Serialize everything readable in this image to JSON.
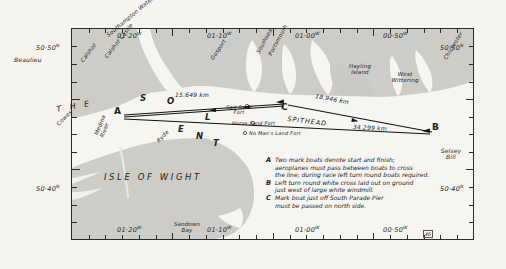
{
  "map": {
    "title": "The Solent air race course map",
    "plate_number": "46",
    "region_labels": {
      "the": "T H E",
      "solent": "S O L E N T",
      "isle_of_wight": "ISLE OF WIGHT",
      "spithead": "SPITHEAD"
    },
    "places": [
      {
        "name": "Beaulieu",
        "x": 14,
        "y": 60
      },
      {
        "name": "Calshot",
        "x": 86,
        "y": 62
      },
      {
        "name": "Calshot Castle",
        "x": 112,
        "y": 58
      },
      {
        "name": "Southampton Water",
        "x": 110,
        "y": 38
      },
      {
        "name": "Gosport",
        "x": 218,
        "y": 62
      },
      {
        "name": "Southsea",
        "x": 262,
        "y": 55
      },
      {
        "name": "Portsmouth",
        "x": 275,
        "y": 56
      },
      {
        "name": "Hayling Island",
        "x": 352,
        "y": 68
      },
      {
        "name": "West Wittering",
        "x": 398,
        "y": 77
      },
      {
        "name": "Chichester",
        "x": 452,
        "y": 62
      },
      {
        "name": "Cowes",
        "x": 62,
        "y": 128
      },
      {
        "name": "Medina River",
        "x": 98,
        "y": 142
      },
      {
        "name": "Ryde",
        "x": 160,
        "y": 142
      },
      {
        "name": "Sandown Bay",
        "x": 178,
        "y": 228
      },
      {
        "name": "Selsey Bill",
        "x": 443,
        "y": 152
      },
      {
        "name": "Spit Sand Fort",
        "x": 228,
        "y": 108
      },
      {
        "name": "Horse Sand Fort",
        "x": 240,
        "y": 126
      },
      {
        "name": "No Man's Land Fort",
        "x": 248,
        "y": 136
      }
    ],
    "marks": [
      {
        "letter": "A",
        "x": 117,
        "y": 115,
        "note": "start-finish line mark boat"
      },
      {
        "letter": "B",
        "x": 430,
        "y": 129,
        "note": "turn round white cross"
      },
      {
        "letter": "C",
        "x": 283,
        "y": 110,
        "note": "mark boat off South Parade Pier"
      }
    ],
    "legs": [
      {
        "label": "15.649 km",
        "from": "A",
        "to": "C",
        "x": 186,
        "y": 99
      },
      {
        "label": "18.946 km",
        "from": "C",
        "to": "B",
        "x": 325,
        "y": 98
      },
      {
        "label": "34.299 km",
        "from": "A",
        "to": "B",
        "x": 365,
        "y": 129
      }
    ],
    "graticule": {
      "latitudes": [
        {
          "label": "50·50",
          "hemisphere": "N",
          "side": "left",
          "x": 36,
          "y": 44
        },
        {
          "label": "50·50",
          "hemisphere": "N",
          "side": "right",
          "x": 440,
          "y": 44
        },
        {
          "label": "50·40",
          "hemisphere": "N",
          "side": "left",
          "x": 36,
          "y": 185
        },
        {
          "label": "50·40",
          "hemisphere": "N",
          "side": "right",
          "x": 440,
          "y": 185
        }
      ],
      "longitudes": [
        {
          "label": "01·20",
          "hemisphere": "W",
          "side": "top",
          "x": 117,
          "y": 32
        },
        {
          "label": "01·10",
          "hemisphere": "W",
          "side": "top",
          "x": 207,
          "y": 32
        },
        {
          "label": "01·00",
          "hemisphere": "W",
          "side": "top",
          "x": 295,
          "y": 32
        },
        {
          "label": "00·50",
          "hemisphere": "W",
          "side": "top",
          "x": 383,
          "y": 32
        },
        {
          "label": "01·20",
          "hemisphere": "W",
          "side": "bottom",
          "x": 117,
          "y": 226
        },
        {
          "label": "01·10",
          "hemisphere": "W",
          "side": "bottom",
          "x": 207,
          "y": 226
        },
        {
          "label": "01·00",
          "hemisphere": "W",
          "side": "bottom",
          "x": 295,
          "y": 226
        },
        {
          "label": "00·50",
          "hemisphere": "W",
          "side": "bottom",
          "x": 383,
          "y": 226
        }
      ]
    },
    "notes": [
      {
        "key": "A",
        "lines": [
          "Two mark boats denote start and finish;",
          "aeroplanes must pass between boats to cross",
          "the line; during race left turn round boats required."
        ]
      },
      {
        "key": "B",
        "lines": [
          "Left turn round white cross laid out on ground",
          "just west of large white windmill."
        ]
      },
      {
        "key": "C",
        "lines": [
          "Mark boat just off South Parade Pier",
          "must be passed on north side."
        ]
      }
    ],
    "colors": {
      "sea": "#f4f3ef",
      "land": "#cfcdc7",
      "ink": "#1d1d1d",
      "frame": "#2b2b2b"
    }
  }
}
